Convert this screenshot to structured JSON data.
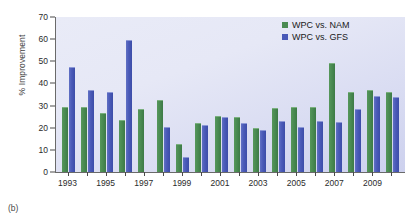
{
  "caption": "(b)",
  "axes": {
    "ylabel": "% Improvement",
    "xlabel": "",
    "yticks": [
      0,
      10,
      20,
      30,
      40,
      50,
      60,
      70
    ],
    "xtick_labels": [
      "1993",
      "1995",
      "1997",
      "1999",
      "2001",
      "2003",
      "2005",
      "2007",
      "2009"
    ]
  },
  "legend": {
    "position": "top-right",
    "entries": [
      {
        "label": "WPC vs. NAM",
        "color": "#4a8b52"
      },
      {
        "label": "WPC vs. GFS",
        "color": "#4a5ab8"
      }
    ]
  },
  "chart_data": {
    "type": "bar",
    "title": "",
    "subtitle": "",
    "xlabel": "",
    "ylabel": "% Improvement",
    "ylim": [
      0,
      70
    ],
    "ytick_step": 10,
    "grid": false,
    "legend_position": "top-right",
    "categories": [
      "1993",
      "1994",
      "1995",
      "1996",
      "1997",
      "1998",
      "1999",
      "2000",
      "2001",
      "2002",
      "2003",
      "2004",
      "2005",
      "2006",
      "2007",
      "2008",
      "2009",
      "2010"
    ],
    "series": [
      {
        "name": "WPC vs. NAM",
        "color": "#4a8b52",
        "values": [
          29,
          29,
          26,
          23,
          28,
          32,
          12,
          21.5,
          25,
          24.5,
          19.5,
          28.5,
          29,
          29,
          49,
          35.5,
          36.5,
          35.5
        ]
      },
      {
        "name": "WPC vs. GFS",
        "color": "#4a5ab8",
        "values": [
          47,
          36.5,
          35.5,
          59,
          null,
          20,
          6.5,
          21,
          24.5,
          21.5,
          18.5,
          22.5,
          20,
          22.5,
          22,
          28,
          34,
          33.5
        ]
      }
    ]
  }
}
